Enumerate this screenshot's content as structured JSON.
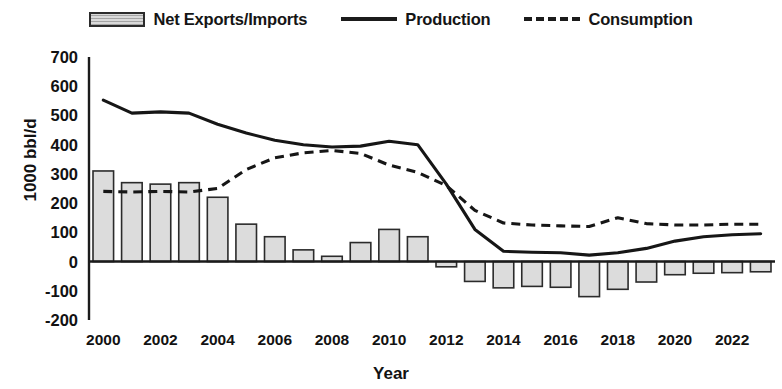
{
  "legend": {
    "items": [
      {
        "label": "Net Exports/Imports",
        "marker": "bar-swatch-icon"
      },
      {
        "label": "Production",
        "marker": "solid-line-icon"
      },
      {
        "label": "Consumption",
        "marker": "dashed-line-icon"
      }
    ]
  },
  "axes": {
    "ylabel": "1000 bbl/d",
    "xlabel": "Year",
    "yticks": [
      "700",
      "600",
      "500",
      "400",
      "300",
      "200",
      "100",
      "0",
      "-100",
      "-200"
    ],
    "xticks": [
      "2000",
      "2002",
      "2004",
      "2006",
      "2008",
      "2010",
      "2012",
      "2014",
      "2016",
      "2018",
      "2020",
      "2022"
    ]
  },
  "chart_data": {
    "type": "bar",
    "title": "",
    "xlabel": "Year",
    "ylabel": "1000 bbl/d",
    "ylim": [
      -200,
      700
    ],
    "ytick_step": 100,
    "grid": false,
    "legend_position": "top-center",
    "categories": [
      2000,
      2001,
      2002,
      2003,
      2004,
      2005,
      2006,
      2007,
      2008,
      2009,
      2010,
      2011,
      2012,
      2013,
      2014,
      2015,
      2016,
      2017,
      2018,
      2019,
      2020,
      2021,
      2022,
      2023
    ],
    "series": [
      {
        "name": "Net Exports/Imports",
        "type": "bar",
        "values": [
          310,
          270,
          265,
          270,
          220,
          128,
          85,
          40,
          18,
          65,
          110,
          85,
          -18,
          -68,
          -90,
          -85,
          -88,
          -120,
          -95,
          -70,
          -45,
          -40,
          -38,
          -35
        ]
      },
      {
        "name": "Production",
        "type": "line",
        "style": "solid",
        "values": [
          552,
          508,
          512,
          508,
          470,
          440,
          415,
          400,
          392,
          395,
          412,
          400,
          265,
          110,
          35,
          32,
          30,
          22,
          30,
          45,
          70,
          85,
          92,
          95
        ]
      },
      {
        "name": "Consumption",
        "type": "line",
        "style": "dashed",
        "values": [
          240,
          238,
          240,
          238,
          250,
          315,
          355,
          372,
          380,
          370,
          330,
          305,
          260,
          175,
          132,
          125,
          122,
          120,
          150,
          130,
          125,
          125,
          128,
          128
        ]
      }
    ]
  }
}
